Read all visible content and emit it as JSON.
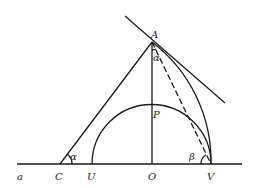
{
  "diagram": {
    "points": {
      "a": "a",
      "C": "C",
      "U": "U",
      "O": "O",
      "V": "V",
      "A": "A",
      "P": "P"
    },
    "angles": {
      "alpha_at_C": "α",
      "alpha_at_A": "α",
      "beta_at_V": "β"
    },
    "colors": {
      "stroke": "#1a1a1a",
      "background": "#ffffff"
    }
  }
}
